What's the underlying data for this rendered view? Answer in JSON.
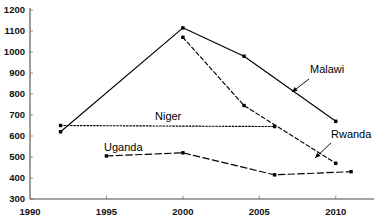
{
  "chart_data": {
    "type": "line",
    "title": "",
    "xlabel": "",
    "ylabel": "",
    "xlim": [
      1990,
      2012.5
    ],
    "ylim": [
      300,
      1200
    ],
    "grid": false,
    "legend_position": "inline-annotations",
    "x_ticks": [
      1990,
      1995,
      2000,
      2005,
      2010
    ],
    "x_tick_labels": [
      "1990",
      "1995",
      "2000",
      "2005",
      "2010"
    ],
    "y_ticks": [
      300,
      400,
      500,
      600,
      700,
      800,
      900,
      1000,
      1100,
      1200
    ],
    "y_tick_labels": [
      "300",
      "400",
      "500",
      "600",
      "700",
      "800",
      "900",
      "1000",
      "1100",
      "1200"
    ],
    "series": [
      {
        "name": "Malawi",
        "line_style": "solid",
        "x": [
          1992,
          2000,
          2004,
          2010
        ],
        "values": [
          620,
          1115,
          980,
          670
        ],
        "label_text": "Malawi",
        "label_x": 310,
        "label_y": 73,
        "arrow_from_x": 309,
        "arrow_from_y": 79,
        "arrow_to_x": 292,
        "arrow_to_y": 92
      },
      {
        "name": "Rwanda",
        "line_style": "dashed",
        "x": [
          2000,
          2004,
          2010
        ],
        "values": [
          1070,
          745,
          470
        ],
        "label_text": "Rwanda",
        "label_x": 331,
        "label_y": 138,
        "arrow_from_x": 331,
        "arrow_from_y": 143,
        "arrow_to_x": 315,
        "arrow_to_y": 158
      },
      {
        "name": "Niger",
        "line_style": "dotted",
        "x": [
          1992,
          2006
        ],
        "values": [
          650,
          645
        ],
        "label_text": "Niger",
        "label_x": 155,
        "label_y": 120,
        "arrow_from_x": null,
        "arrow_from_y": null,
        "arrow_to_x": null,
        "arrow_to_y": null
      },
      {
        "name": "Uganda",
        "line_style": "longdash",
        "x": [
          1995,
          2000,
          2006,
          2011
        ],
        "values": [
          505,
          520,
          415,
          430
        ],
        "label_text": "Uganda",
        "label_x": 104,
        "label_y": 151,
        "arrow_from_x": null,
        "arrow_from_y": null,
        "arrow_to_x": null,
        "arrow_to_y": null
      }
    ]
  },
  "colors": {
    "background": "#ffffff",
    "axis": "#4d4d4d",
    "series": "#000000",
    "text": "#111111"
  }
}
